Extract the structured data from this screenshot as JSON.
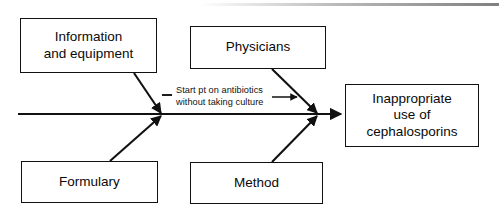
{
  "diagram": {
    "type": "fishbone-cause-and-effect",
    "title": "",
    "effect": {
      "label": "Inappropriate\nuse of\ncephalosporins",
      "name": "effect-box"
    },
    "causes": [
      {
        "name": "cause-box-information-and-equipment",
        "label": "Information\nand equipment",
        "position": "upper-left"
      },
      {
        "name": "cause-box-physicians",
        "label": "Physicians",
        "position": "upper-middle"
      },
      {
        "name": "cause-box-formulary",
        "label": "Formulary",
        "position": "lower-left"
      },
      {
        "name": "cause-box-method",
        "label": "Method",
        "position": "lower-middle"
      }
    ],
    "annotations": [
      {
        "name": "annotation-start-pt-on-antibiotics",
        "label": "Start pt on antibiotics\nwithout taking culture",
        "leader_dash": true,
        "leader_arrow": "right"
      }
    ],
    "colors": {
      "stroke": "#111111",
      "text": "#0a0a0a",
      "background": "#ffffff"
    }
  }
}
